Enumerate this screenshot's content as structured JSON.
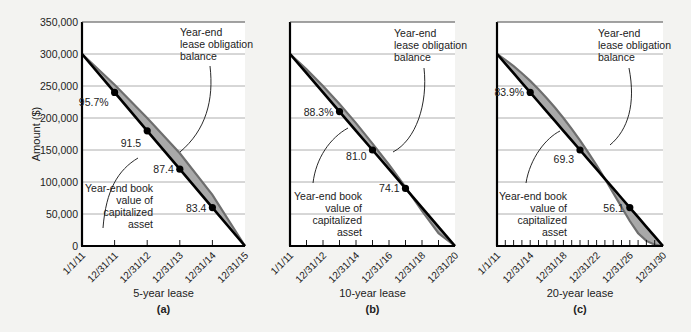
{
  "colors": {
    "background": "#f3f3f1",
    "plot_background": "#ffffff",
    "band_fill": "#a9a9a9",
    "obligation_line": "#6e6e6e",
    "book_value_line": "#000000",
    "gridline": "#9a9a9a"
  },
  "y_axis": {
    "label": "Amount ($)",
    "ticks": [
      "0",
      "50,000",
      "100,000",
      "150,000",
      "200,000",
      "250,000",
      "300,000",
      "350,000"
    ],
    "range": [
      0,
      350000
    ]
  },
  "annotations": {
    "obligation": [
      "Year-end",
      "lease obligation",
      "balance"
    ],
    "book_value": [
      "Year-end book",
      "value of",
      "capitalized",
      "asset"
    ]
  },
  "chart_data": [
    {
      "type": "area",
      "panel": "(a)",
      "title": "5-year lease",
      "xlabel": "5-year lease",
      "ylabel": "Amount ($)",
      "ylim": [
        0,
        350000
      ],
      "grid": true,
      "x_tick_labels": [
        "1/1/11",
        "12/31/11",
        "12/31/12",
        "12/31/13",
        "12/31/14",
        "12/31/15"
      ],
      "n_years": 5,
      "series": [
        {
          "name": "Year-end lease obligation balance",
          "values": [
            300000,
            252000,
            200000,
            145000,
            80000,
            0
          ]
        },
        {
          "name": "Year-end book value of capitalized asset",
          "values": [
            300000,
            240000,
            180000,
            120000,
            60000,
            0
          ]
        }
      ],
      "point_labels": [
        {
          "year": 1,
          "text": "95.7%"
        },
        {
          "year": 2,
          "text": "91.5"
        },
        {
          "year": 3,
          "text": "87.4"
        },
        {
          "year": 4,
          "text": "83.4"
        }
      ]
    },
    {
      "type": "area",
      "panel": "(b)",
      "title": "10-year lease",
      "xlabel": "10-year lease",
      "ylabel": "Amount ($)",
      "ylim": [
        0,
        350000
      ],
      "grid": true,
      "x_tick_labels": [
        "1/1/11",
        "12/31/12",
        "12/31/14",
        "12/31/16",
        "12/31/18",
        "12/31/20"
      ],
      "n_years": 10,
      "series": [
        {
          "name": "Year-end lease obligation balance",
          "values": [
            300000,
            276000,
            250000,
            222000,
            192000,
            160000,
            127000,
            92000,
            55000,
            20000,
            0
          ]
        },
        {
          "name": "Year-end book value of capitalized asset",
          "values": [
            300000,
            270000,
            240000,
            210000,
            180000,
            150000,
            120000,
            90000,
            60000,
            30000,
            0
          ]
        }
      ],
      "point_labels": [
        {
          "year": 3,
          "text": "88.3%"
        },
        {
          "year": 5,
          "text": "81.0"
        },
        {
          "year": 7,
          "text": "74.1"
        }
      ]
    },
    {
      "type": "area",
      "panel": "(c)",
      "title": "20-year lease",
      "xlabel": "20-year lease",
      "ylabel": "Amount ($)",
      "ylim": [
        0,
        350000
      ],
      "grid": true,
      "x_tick_labels": [
        "1/1/11",
        "12/31/14",
        "12/31/18",
        "12/31/22",
        "12/31/26",
        "12/31/30"
      ],
      "n_years": 20,
      "series": [
        {
          "name": "Year-end lease obligation balance",
          "values": [
            300000,
            291000,
            281000,
            270000,
            258000,
            245000,
            231000,
            216000,
            200000,
            183000,
            165000,
            146000,
            126000,
            105000,
            83000,
            61000,
            39000,
            20000,
            8000,
            2000,
            0
          ]
        },
        {
          "name": "Year-end book value of capitalized asset",
          "values": [
            300000,
            285000,
            270000,
            255000,
            240000,
            225000,
            210000,
            195000,
            180000,
            165000,
            150000,
            135000,
            120000,
            105000,
            90000,
            75000,
            60000,
            45000,
            30000,
            15000,
            0
          ]
        }
      ],
      "point_labels": [
        {
          "year": 4,
          "text": "83.9%"
        },
        {
          "year": 10,
          "text": "69.3"
        },
        {
          "year": 16,
          "text": "56.1"
        }
      ]
    }
  ]
}
